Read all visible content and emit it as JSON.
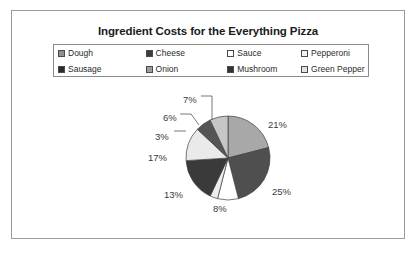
{
  "chart_data": {
    "type": "pie",
    "title": "Ingredient Costs for the Everything Pizza",
    "categories": [
      "Dough",
      "Cheese",
      "Sauce",
      "Pepperoni",
      "Sausage",
      "Onion",
      "Mushroom",
      "Green Pepper"
    ],
    "values": [
      21,
      25,
      8,
      3,
      17,
      13,
      6,
      7
    ],
    "value_labels": [
      "21%",
      "25%",
      "8%",
      "3%",
      "17%",
      "13%",
      "6%",
      "7%"
    ],
    "unit": "%",
    "legend_position": "top",
    "grid": false,
    "start_angle_deg": 0,
    "direction": "clockwise",
    "slice_colors": [
      "#a8a8a8",
      "#4f4f4f",
      "#ffffff",
      "#ededed",
      "#3a3a3a",
      "#eaeaea",
      "#555555",
      "#c6c6c6"
    ],
    "slices": [
      {
        "label": "Dough",
        "value": 21,
        "text": "21%",
        "color": "#a8a8a8",
        "swatch": "#8f8f8f"
      },
      {
        "label": "Cheese",
        "value": 25,
        "text": "25%",
        "color": "#4f4f4f",
        "swatch": "#3d3d3d"
      },
      {
        "label": "Sauce",
        "value": 8,
        "text": "8%",
        "color": "#ffffff",
        "swatch": "#ffffff"
      },
      {
        "label": "Pepperoni",
        "value": 3,
        "text": "3%",
        "color": "#ededed",
        "swatch": "#f2f2f2"
      },
      {
        "label": "Sausage",
        "value": 17,
        "text": "17%",
        "color": "#3a3a3a",
        "swatch": "#2b2b2b"
      },
      {
        "label": "Onion",
        "value": 13,
        "text": "13%",
        "color": "#eaeaea",
        "swatch": "#9e9e9e"
      },
      {
        "label": "Mushroom",
        "value": 6,
        "text": "6%",
        "color": "#555555",
        "swatch": "#333333"
      },
      {
        "label": "Green Pepper",
        "value": 7,
        "text": "7%",
        "color": "#c6c6c6",
        "swatch": "#e2e2e2"
      }
    ]
  },
  "legend": {
    "rows": [
      [
        {
          "label": "Dough",
          "swatch": "#8f8f8f"
        },
        {
          "label": "Cheese",
          "swatch": "#3d3d3d"
        },
        {
          "label": "Sauce",
          "swatch": "#ffffff"
        },
        {
          "label": "Pepperoni",
          "swatch": "#f2f2f2"
        }
      ],
      [
        {
          "label": "Sausage",
          "swatch": "#2b2b2b"
        },
        {
          "label": "Onion",
          "swatch": "#9e9e9e"
        },
        {
          "label": "Mushroom",
          "swatch": "#333333"
        },
        {
          "label": "Green Pepper",
          "swatch": "#e2e2e2"
        }
      ]
    ]
  },
  "labels": [
    {
      "text": "21%",
      "x": 268,
      "y": 119
    },
    {
      "text": "25%",
      "x": 272,
      "y": 186
    },
    {
      "text": "8%",
      "x": 213,
      "y": 203
    },
    {
      "text": "13%",
      "x": 164,
      "y": 189
    },
    {
      "text": "17%",
      "x": 148,
      "y": 152
    },
    {
      "text": "3%",
      "x": 155,
      "y": 131
    },
    {
      "text": "6%",
      "x": 163,
      "y": 112
    },
    {
      "text": "7%",
      "x": 183,
      "y": 94
    }
  ],
  "geometry": {
    "center_x": 228,
    "center_y": 158,
    "radius": 42
  },
  "style": {
    "frame_border": "#9a9a9a",
    "legend_border": "#8c8c8c",
    "text_color": "#2a2a2a",
    "background": "#ffffff"
  }
}
